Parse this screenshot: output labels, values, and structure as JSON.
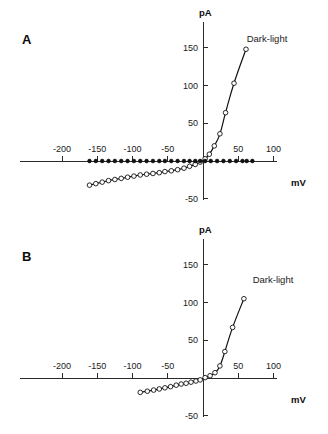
{
  "figure": {
    "panels": [
      {
        "letter": "A",
        "annotation": "Dark-light",
        "x_axis_title": "mV",
        "y_axis_title": "pA"
      },
      {
        "letter": "B",
        "annotation": "Dark-light",
        "x_axis_title": "mV",
        "y_axis_title": "pA"
      }
    ]
  },
  "chart_data": [
    {
      "type": "scatter",
      "title": "A",
      "xlabel": "mV",
      "ylabel": "pA",
      "xlim": [
        -200,
        100
      ],
      "ylim": [
        -50,
        150
      ],
      "xticks": [
        -200,
        -150,
        -100,
        -50,
        0,
        50,
        100
      ],
      "xtick_labels": [
        "-200",
        "-150",
        "-100",
        "-50",
        "",
        "50",
        "100"
      ],
      "yticks": [
        -50,
        50,
        100,
        150
      ],
      "ytick_labels": [
        "-50",
        "50",
        "100",
        "150"
      ],
      "grid": false,
      "legend_position": "upper-right-inline",
      "annotations": [
        {
          "text": "Dark-light",
          "x": 70,
          "y": 140
        }
      ],
      "series": [
        {
          "name": "Dark-light",
          "marker": "open-circle",
          "line": true,
          "points": [
            {
              "x": -161,
              "y": -32
            },
            {
              "x": -152,
              "y": -30
            },
            {
              "x": -143,
              "y": -28
            },
            {
              "x": -134,
              "y": -26
            },
            {
              "x": -125,
              "y": -24.5
            },
            {
              "x": -116,
              "y": -23
            },
            {
              "x": -107,
              "y": -21.5
            },
            {
              "x": -98,
              "y": -20
            },
            {
              "x": -89,
              "y": -18.5
            },
            {
              "x": -80,
              "y": -17.5
            },
            {
              "x": -71,
              "y": -16.5
            },
            {
              "x": -62,
              "y": -15.5
            },
            {
              "x": -54,
              "y": -14
            },
            {
              "x": -45,
              "y": -13
            },
            {
              "x": -36,
              "y": -11.5
            },
            {
              "x": -27,
              "y": -9.5
            },
            {
              "x": -19,
              "y": -7
            },
            {
              "x": -11,
              "y": -4.5
            },
            {
              "x": -4,
              "y": -1.5
            },
            {
              "x": 3,
              "y": 3
            },
            {
              "x": 9,
              "y": 9
            },
            {
              "x": 16,
              "y": 20
            },
            {
              "x": 24,
              "y": 36
            },
            {
              "x": 32,
              "y": 64
            },
            {
              "x": 44,
              "y": 103
            },
            {
              "x": 61,
              "y": 148
            }
          ]
        },
        {
          "name": "baseline",
          "marker": "filled-circle",
          "line": false,
          "points": [
            {
              "x": -161,
              "y": 0
            },
            {
              "x": -152,
              "y": 0
            },
            {
              "x": -143,
              "y": 0
            },
            {
              "x": -134,
              "y": 0
            },
            {
              "x": -125,
              "y": 0
            },
            {
              "x": -116,
              "y": 0
            },
            {
              "x": -107,
              "y": 0
            },
            {
              "x": -98,
              "y": 0
            },
            {
              "x": -89,
              "y": 0
            },
            {
              "x": -80,
              "y": 0
            },
            {
              "x": -71,
              "y": 0
            },
            {
              "x": -62,
              "y": 0
            },
            {
              "x": -54,
              "y": 0
            },
            {
              "x": -45,
              "y": 0
            },
            {
              "x": -36,
              "y": 0
            },
            {
              "x": -27,
              "y": 0
            },
            {
              "x": -19,
              "y": 0
            },
            {
              "x": -11,
              "y": 0
            },
            {
              "x": -4,
              "y": 0
            },
            {
              "x": 3,
              "y": 0
            },
            {
              "x": 11,
              "y": 0
            },
            {
              "x": 20,
              "y": 0
            },
            {
              "x": 29,
              "y": 0
            },
            {
              "x": 38,
              "y": 0
            },
            {
              "x": 47,
              "y": 0
            },
            {
              "x": 56,
              "y": 0
            },
            {
              "x": 62,
              "y": 0
            },
            {
              "x": 70,
              "y": 0
            }
          ]
        }
      ]
    },
    {
      "type": "scatter",
      "title": "B",
      "xlabel": "mV",
      "ylabel": "pA",
      "xlim": [
        -200,
        100
      ],
      "ylim": [
        -50,
        150
      ],
      "xticks": [
        -200,
        -150,
        -100,
        -50,
        0,
        50,
        100
      ],
      "xtick_labels": [
        "-200",
        "-150",
        "-100",
        "-50",
        "",
        "50",
        "100"
      ],
      "yticks": [
        -50,
        50,
        100,
        150
      ],
      "ytick_labels": [
        "-50",
        "50",
        "100",
        "150"
      ],
      "grid": false,
      "legend_position": "upper-right-inline",
      "annotations": [
        {
          "text": "Dark-light",
          "x": 72,
          "y": 100
        }
      ],
      "series": [
        {
          "name": "Dark-light",
          "marker": "open-circle",
          "line": true,
          "points": [
            {
              "x": -89,
              "y": -19
            },
            {
              "x": -79,
              "y": -17.5
            },
            {
              "x": -70,
              "y": -16
            },
            {
              "x": -62,
              "y": -14.5
            },
            {
              "x": -54,
              "y": -13
            },
            {
              "x": -46,
              "y": -11.5
            },
            {
              "x": -38,
              "y": -9.5
            },
            {
              "x": -31,
              "y": -8
            },
            {
              "x": -24,
              "y": -7
            },
            {
              "x": -17,
              "y": -5.5
            },
            {
              "x": -10,
              "y": -4
            },
            {
              "x": -4,
              "y": -2.5
            },
            {
              "x": 3,
              "y": 0.5
            },
            {
              "x": 10,
              "y": 3
            },
            {
              "x": 17,
              "y": 7
            },
            {
              "x": 24,
              "y": 16
            },
            {
              "x": 31,
              "y": 35
            },
            {
              "x": 42,
              "y": 67
            },
            {
              "x": 58,
              "y": 105
            }
          ]
        }
      ]
    }
  ]
}
